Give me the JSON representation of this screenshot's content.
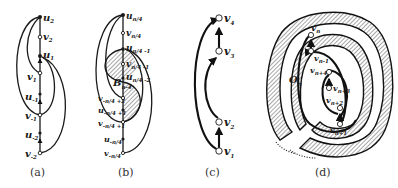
{
  "figure": {
    "panels": [
      {
        "id": "a",
        "caption": "(a)",
        "vertices": [
          {
            "name": "u",
            "sub": "2",
            "type": "filled"
          },
          {
            "name": "v",
            "sub": "2",
            "type": "open"
          },
          {
            "name": "u",
            "sub": "1",
            "type": "filled"
          },
          {
            "name": "v",
            "sub": "1",
            "type": "open"
          },
          {
            "name": "u",
            "sub": "-1",
            "type": "filled"
          },
          {
            "name": "v",
            "sub": "-1",
            "type": "open"
          },
          {
            "name": "u",
            "sub": "-2",
            "type": "filled"
          },
          {
            "name": "v",
            "sub": "-2",
            "type": "open"
          }
        ]
      },
      {
        "id": "b",
        "caption": "(b)",
        "region_label": {
          "name": "B",
          "sub": "n-4"
        },
        "vertices": [
          {
            "name": "u",
            "sub": "n/4",
            "type": "filled"
          },
          {
            "name": "v",
            "sub": "n/4",
            "type": "open"
          },
          {
            "name": "u",
            "sub": "n/4 -1",
            "type": "filled"
          },
          {
            "name": "v",
            "sub": "n/4 -1",
            "type": "open"
          },
          {
            "name": "u",
            "sub": "n/4 -2",
            "type": "filled"
          },
          {
            "name": "v",
            "sub": "-n/4 +2",
            "type": "open"
          },
          {
            "name": "u",
            "sub": "-n/4 +1",
            "type": "filled"
          },
          {
            "name": "v",
            "sub": "-n/4 +1",
            "type": "open"
          },
          {
            "name": "u",
            "sub": "-n/4",
            "type": "filled"
          },
          {
            "name": "v",
            "sub": "-n/4",
            "type": "open"
          }
        ]
      },
      {
        "id": "c",
        "caption": "(c)",
        "vertices": [
          {
            "name": "v",
            "sub": "4",
            "type": "open"
          },
          {
            "name": "v",
            "sub": "3",
            "type": "open"
          },
          {
            "name": "v",
            "sub": "2",
            "type": "open"
          },
          {
            "name": "v",
            "sub": "1",
            "type": "open"
          }
        ]
      },
      {
        "id": "d",
        "caption": "(d)",
        "region_label": {
          "name": "O",
          "sub": "n"
        },
        "vertices": [
          {
            "name": "v",
            "sub": "n",
            "type": "open"
          },
          {
            "name": "v",
            "sub": "n-1",
            "type": "open"
          },
          {
            "name": "v",
            "sub": "n+4",
            "type": "open"
          },
          {
            "name": "v",
            "sub": "n+3",
            "type": "open"
          },
          {
            "name": "v",
            "sub": "n+2",
            "type": "open"
          },
          {
            "name": "v",
            "sub": "n+1",
            "type": "open"
          }
        ]
      }
    ]
  }
}
